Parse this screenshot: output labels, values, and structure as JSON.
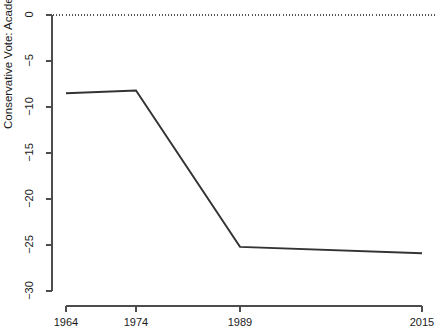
{
  "chart_data": {
    "type": "line",
    "title": "",
    "subtitle": "",
    "xlabel": "",
    "ylabel": "Conservative Vote: Academics (%) − Public (%)",
    "x": [
      1964,
      1974,
      1989,
      2015
    ],
    "values": [
      -8.5,
      -8.2,
      -25.2,
      -25.9
    ],
    "series": [
      {
        "name": "Conservative Vote: Academics (%) − Public (%)",
        "values": [
          -8.5,
          -8.2,
          -25.2,
          -25.9
        ]
      }
    ],
    "xlim": [
      1964,
      2015
    ],
    "ylim": [
      -30,
      0
    ],
    "x_tick_labels": [
      "1964",
      "1974",
      "1989",
      "2015"
    ],
    "x_tick_values": [
      1964,
      1974,
      1989,
      2015
    ],
    "y_tick_labels": [
      "0",
      "−5",
      "−10",
      "−15",
      "−20",
      "−25",
      "−30"
    ],
    "y_tick_values": [
      0,
      -5,
      -10,
      -15,
      -20,
      -25,
      -30
    ],
    "grid": false,
    "legend": null,
    "annotations": [
      {
        "name": "zero-reference-line",
        "type": "hline",
        "value": 0,
        "style": "dotted"
      }
    ],
    "colors": {
      "line": "#333333",
      "axis": "#4d4d4d",
      "text": "#1a1a1a",
      "reference_line": "#555555",
      "background": "#ffffff"
    }
  }
}
